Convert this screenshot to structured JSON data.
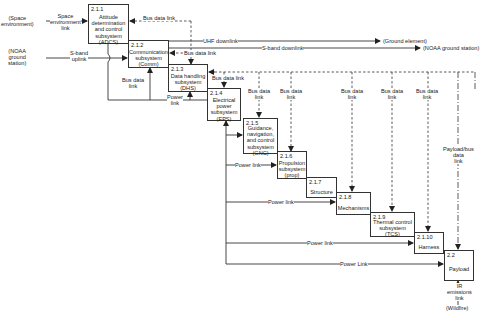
{
  "diagram": {
    "type": "spacecraft subsystem N2 interface diagram",
    "boxes": [
      {
        "id": "2.1.1",
        "name": "Attitude\ndetermination\nand control\nsubsystem\n(ADCS)"
      },
      {
        "id": "2.1.2",
        "name": "Communication\nsubsystem\n(Comm)"
      },
      {
        "id": "2.1.3",
        "name": "Data handling\nsubsystem\n(DHS)"
      },
      {
        "id": "2.1.4",
        "name": "Electrical\npower\nsubsystem\n(EPS)"
      },
      {
        "id": "2.1.5",
        "name": "Guidance,\nnavigation,\nand control\nsubsystem\n(GNC)"
      },
      {
        "id": "2.1.6",
        "name": "Propulsion\nsubsystem\n(prop)"
      },
      {
        "id": "2.1.7",
        "name": "Structure"
      },
      {
        "id": "2.1.8",
        "name": "Mechanisms"
      },
      {
        "id": "2.1.9",
        "name": "Thermal control\nsubsystem\n(TCS)"
      },
      {
        "id": "2.1.10",
        "name": "Harness"
      },
      {
        "id": "2.2",
        "name": "Payload"
      }
    ],
    "external": {
      "space_env": "(Space\nenvironment)",
      "noaa_ground": "(NOAA\nground\nstation)",
      "ground_element": "(Ground element)",
      "noaa_ground_station": "(NOAA ground station)",
      "wildfire": "(Wildfire)"
    },
    "links": {
      "space_env_link": "Space\nenvironment\nlink",
      "s_band_uplink": "S-band\nuplink",
      "uhf_downlink": "UHF downlink",
      "s_band_downlink": "S-band downlink",
      "bus_data_link": "Bus data link",
      "bus_data_link_2": "Bus data link",
      "bus_data_link_3": "Bus data link",
      "bus_data_link_stack": "Bus data\nlink",
      "power_link_stack": "Power\nlink",
      "power_link": "Power link",
      "power_link_cap": "Power Link",
      "payload_bus_data_link": "Payload/bus\ndata\nlink",
      "ir_emissions_link": "IR\nemissions\nlink"
    }
  }
}
